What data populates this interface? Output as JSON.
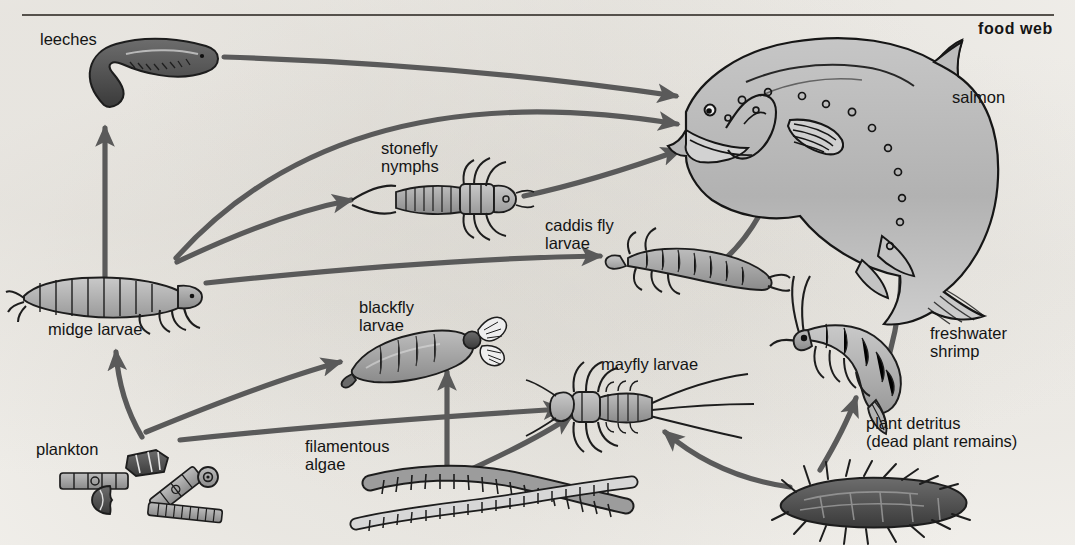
{
  "document": {
    "title": "food web",
    "kind": "ecology-food-web-diagram",
    "background_color": "#f5f3ef",
    "ink_color": "#141414",
    "arrow_color": "#5a5a5a"
  },
  "labels": {
    "leeches": "leeches",
    "salmon": "salmon",
    "stonefly_nymphs_line1": "stonefly",
    "stonefly_nymphs_line2": "nymphs",
    "caddis_fly_line1": "caddis fly",
    "caddis_fly_line2": "larvae",
    "midge_larvae": "midge larvae",
    "blackfly_line1": "blackfly",
    "blackfly_line2": "larvae",
    "mayfly_larvae": "mayfly larvae",
    "freshwater_shrimp_line1": "freshwater",
    "freshwater_shrimp_line2": "shrimp",
    "plankton": "plankton",
    "filamentous_algae_line1": "filamentous",
    "filamentous_algae_line2": "algae",
    "plant_detritus_line1": "plant detritus",
    "plant_detritus_line2": "(dead plant remains)"
  },
  "organisms": [
    {
      "id": "leeches",
      "label": "leeches",
      "trophic": "predator"
    },
    {
      "id": "salmon",
      "label": "salmon",
      "trophic": "top-predator"
    },
    {
      "id": "stonefly-nymphs",
      "label": "stonefly nymphs",
      "trophic": "predator"
    },
    {
      "id": "caddis-fly-larvae",
      "label": "caddis fly larvae",
      "trophic": "consumer"
    },
    {
      "id": "midge-larvae",
      "label": "midge larvae",
      "trophic": "consumer"
    },
    {
      "id": "blackfly-larvae",
      "label": "blackfly larvae",
      "trophic": "consumer"
    },
    {
      "id": "mayfly-larvae",
      "label": "mayfly larvae",
      "trophic": "consumer"
    },
    {
      "id": "freshwater-shrimp",
      "label": "freshwater shrimp",
      "trophic": "consumer"
    },
    {
      "id": "plankton",
      "label": "plankton",
      "trophic": "producer"
    },
    {
      "id": "filamentous-algae",
      "label": "filamentous algae",
      "trophic": "producer"
    },
    {
      "id": "plant-detritus",
      "label": "plant detritus (dead plant remains)",
      "trophic": "detritus"
    }
  ],
  "feeding_links": [
    {
      "from": "plankton",
      "to": "midge-larvae"
    },
    {
      "from": "plankton",
      "to": "blackfly-larvae"
    },
    {
      "from": "plankton",
      "to": "mayfly-larvae"
    },
    {
      "from": "midge-larvae",
      "to": "leeches"
    },
    {
      "from": "midge-larvae",
      "to": "salmon"
    },
    {
      "from": "midge-larvae",
      "to": "stonefly-nymphs"
    },
    {
      "from": "midge-larvae",
      "to": "caddis-fly-larvae"
    },
    {
      "from": "leeches",
      "to": "salmon"
    },
    {
      "from": "stonefly-nymphs",
      "to": "salmon"
    },
    {
      "from": "caddis-fly-larvae",
      "to": "salmon"
    },
    {
      "from": "freshwater-shrimp",
      "to": "salmon"
    },
    {
      "from": "filamentous-algae",
      "to": "blackfly-larvae"
    },
    {
      "from": "filamentous-algae",
      "to": "mayfly-larvae"
    },
    {
      "from": "plant-detritus",
      "to": "freshwater-shrimp"
    },
    {
      "from": "plant-detritus",
      "to": "mayfly-larvae"
    }
  ]
}
